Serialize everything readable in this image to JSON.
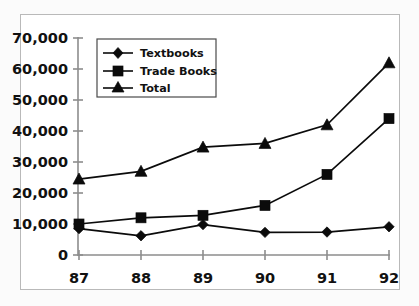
{
  "chart_data": {
    "type": "line",
    "title": "",
    "subtitle": "",
    "xlabel": "",
    "ylabel": "",
    "categories": [
      "87",
      "88",
      "89",
      "90",
      "91",
      "92"
    ],
    "x": [
      87,
      88,
      89,
      90,
      91,
      92
    ],
    "series": [
      {
        "name": "Textbooks",
        "marker": "diamond",
        "color": "#0b0b0b",
        "values": [
          8500,
          6200,
          9800,
          7300,
          7400,
          9100
        ]
      },
      {
        "name": "Trade Books",
        "marker": "square",
        "color": "#0b0b0b",
        "values": [
          10000,
          12000,
          12800,
          16000,
          26000,
          44000
        ]
      },
      {
        "name": "Total",
        "marker": "triangle",
        "color": "#0b0b0b",
        "values": [
          24500,
          27000,
          34800,
          36000,
          42000,
          62000
        ]
      }
    ],
    "ylim": [
      0,
      70000
    ],
    "xlim": [
      87,
      92
    ],
    "yticks": [
      0,
      10000,
      20000,
      30000,
      40000,
      50000,
      60000,
      70000
    ],
    "ytick_labels": [
      "0",
      "10,000",
      "20,000",
      "30,000",
      "40,000",
      "50,000",
      "60,000",
      "70,000"
    ],
    "xtick_labels": [
      "87",
      "88",
      "89",
      "90",
      "91",
      "92"
    ],
    "grid": false,
    "legend_position": "upper-left-inside",
    "legend_entries": [
      "Textbooks",
      "Trade Books",
      "Total"
    ],
    "annotations": []
  },
  "legend": {
    "items": [
      {
        "label": "Textbooks",
        "marker": "diamond-marker"
      },
      {
        "label": "Trade Books",
        "marker": "square-marker"
      },
      {
        "label": "Total",
        "marker": "triangle-marker"
      }
    ]
  },
  "axes": {
    "y_tick_labels": [
      "70,000",
      "60,000",
      "50,000",
      "40,000",
      "30,000",
      "20,000",
      "10,000",
      "0"
    ],
    "x_tick_labels": [
      "87",
      "88",
      "89",
      "90",
      "91",
      "92"
    ]
  },
  "colors": {
    "ink": "#0b0b0b",
    "axis": "#8d8d8d",
    "frame": "#b9b9b9",
    "background": "#ffffff",
    "page": "#fbfbfb"
  }
}
